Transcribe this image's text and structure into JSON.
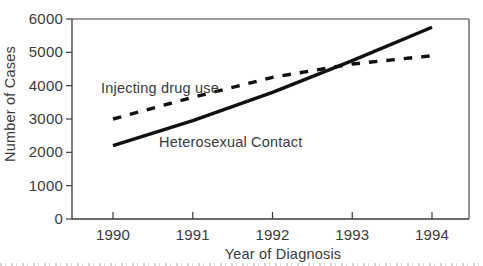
{
  "window": {
    "width": 483,
    "height": 266,
    "background": "#ffffff"
  },
  "chart_data": {
    "type": "line",
    "title": "",
    "xlabel": "Year of Diagnosis",
    "ylabel": "Number of Cases",
    "x": [
      1990,
      1991,
      1992,
      1993,
      1994
    ],
    "ylim": [
      0,
      6000
    ],
    "yticks": [
      0,
      1000,
      2000,
      3000,
      4000,
      5000,
      6000
    ],
    "grid": false,
    "legend": "inline-labels",
    "axis_color": "#3a3a3a",
    "text_color": "#3a3a3a",
    "line_color": "#101010",
    "series": [
      {
        "name": "Injecting drug use",
        "line_style": "dashed",
        "color": "#101010",
        "values": [
          3000,
          3650,
          4250,
          4650,
          4900
        ]
      },
      {
        "name": "Heterosexual Contact",
        "line_style": "solid",
        "color": "#101010",
        "values": [
          2200,
          2950,
          3800,
          4750,
          5750
        ]
      }
    ]
  }
}
